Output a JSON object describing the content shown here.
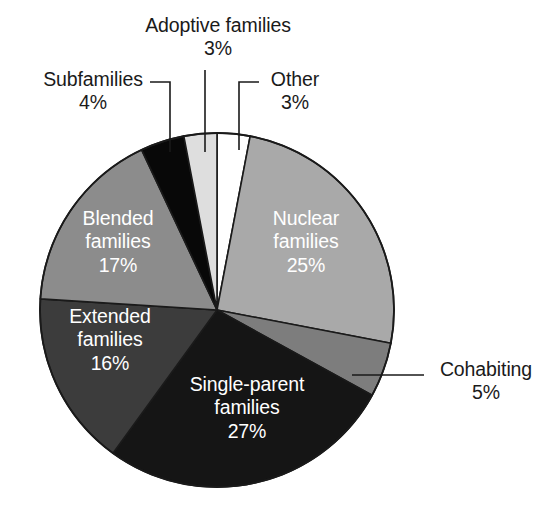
{
  "chart_data": {
    "type": "pie",
    "title": "",
    "subtitle": "",
    "xlabel": "",
    "ylabel": "",
    "legend_position": "none",
    "grid": false,
    "start_angle_deg": 0,
    "direction": "clockwise",
    "unit": "%",
    "categories": [
      "Other",
      "Nuclear families",
      "Cohabiting",
      "Single-parent families",
      "Extended families",
      "Blended families",
      "Subfamilies",
      "Adoptive families"
    ],
    "values": [
      3,
      25,
      5,
      27,
      16,
      17,
      4,
      3
    ],
    "slices": [
      {
        "name": "Other",
        "label": "Other",
        "value": 3,
        "value_text": "3%",
        "color": "#ffffff",
        "label_placement": "outside",
        "label_text_color": "#1a1a1a"
      },
      {
        "name": "Nuclear families",
        "label": "Nuclear\nfamilies",
        "line1": "Nuclear",
        "line2": "families",
        "value": 25,
        "value_text": "25%",
        "color": "#a9a9a9",
        "label_placement": "inside",
        "label_text_color": "#ffffff"
      },
      {
        "name": "Cohabiting",
        "label": "Cohabiting",
        "value": 5,
        "value_text": "5%",
        "color": "#7d7d7d",
        "label_placement": "outside",
        "label_text_color": "#1a1a1a"
      },
      {
        "name": "Single-parent families",
        "label": "Single-parent\nfamilies",
        "line1": "Single-parent",
        "line2": "families",
        "value": 27,
        "value_text": "27%",
        "color": "#151515",
        "label_placement": "inside",
        "label_text_color": "#ffffff"
      },
      {
        "name": "Extended families",
        "label": "Extended\nfamilies",
        "line1": "Extended",
        "line2": "families",
        "value": 16,
        "value_text": "16%",
        "color": "#3c3c3c",
        "label_placement": "inside",
        "label_text_color": "#ffffff"
      },
      {
        "name": "Blended families",
        "label": "Blended\nfamilies",
        "line1": "Blended",
        "line2": "families",
        "value": 17,
        "value_text": "17%",
        "color": "#8c8c8c",
        "label_placement": "inside",
        "label_text_color": "#ffffff"
      },
      {
        "name": "Subfamilies",
        "label": "Subfamilies",
        "value": 4,
        "value_text": "4%",
        "color": "#080808",
        "label_placement": "outside",
        "label_text_color": "#1a1a1a"
      },
      {
        "name": "Adoptive families",
        "label": "Adoptive families",
        "value": 3,
        "value_text": "3%",
        "color": "#dedede",
        "label_placement": "outside",
        "label_text_color": "#1a1a1a"
      }
    ]
  },
  "figure": {
    "background_color": "#ffffff",
    "outline_color": "#1a1a1a",
    "leader_line_color": "#1a1a1a"
  },
  "labels": {
    "adoptive": {
      "name": "Adoptive families",
      "pct": "3%"
    },
    "subfamilies": {
      "name": "Subfamilies",
      "pct": "4%"
    },
    "other": {
      "name": "Other",
      "pct": "3%"
    },
    "cohabiting": {
      "name": "Cohabiting",
      "pct": "5%"
    },
    "nuclear": {
      "line1": "Nuclear",
      "line2": "families",
      "pct": "25%"
    },
    "blended": {
      "line1": "Blended",
      "line2": "families",
      "pct": "17%"
    },
    "extended": {
      "line1": "Extended",
      "line2": "families",
      "pct": "16%"
    },
    "single_parent": {
      "line1": "Single-parent",
      "line2": "families",
      "pct": "27%"
    }
  }
}
